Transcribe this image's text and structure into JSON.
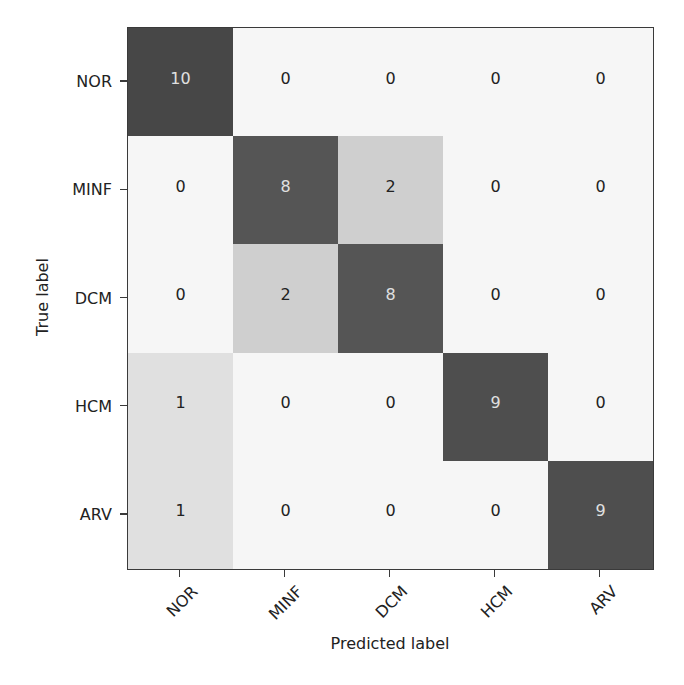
{
  "chart_data": {
    "type": "heatmap",
    "title": "",
    "xlabel": "Predicted label",
    "ylabel": "True label",
    "x_categories": [
      "NOR",
      "MINF",
      "DCM",
      "HCM",
      "ARV"
    ],
    "y_categories": [
      "NOR",
      "MINF",
      "DCM",
      "HCM",
      "ARV"
    ],
    "matrix": [
      [
        10,
        0,
        0,
        0,
        0
      ],
      [
        0,
        8,
        2,
        0,
        0
      ],
      [
        0,
        2,
        8,
        0,
        0
      ],
      [
        1,
        0,
        0,
        9,
        0
      ],
      [
        1,
        0,
        0,
        0,
        9
      ]
    ],
    "colormap": "Greys",
    "value_range": [
      0,
      10
    ],
    "grid": false,
    "legend": "none",
    "colorbar": false
  },
  "style": {
    "cell_colors": {
      "0": "#f6f6f6",
      "1": "#e0e0e0",
      "2": "#cfcfcf",
      "8": "#555555",
      "9": "#4e4e4e",
      "10": "#474747"
    },
    "text_dark": "#222222",
    "text_light": "#e0e0e0"
  }
}
